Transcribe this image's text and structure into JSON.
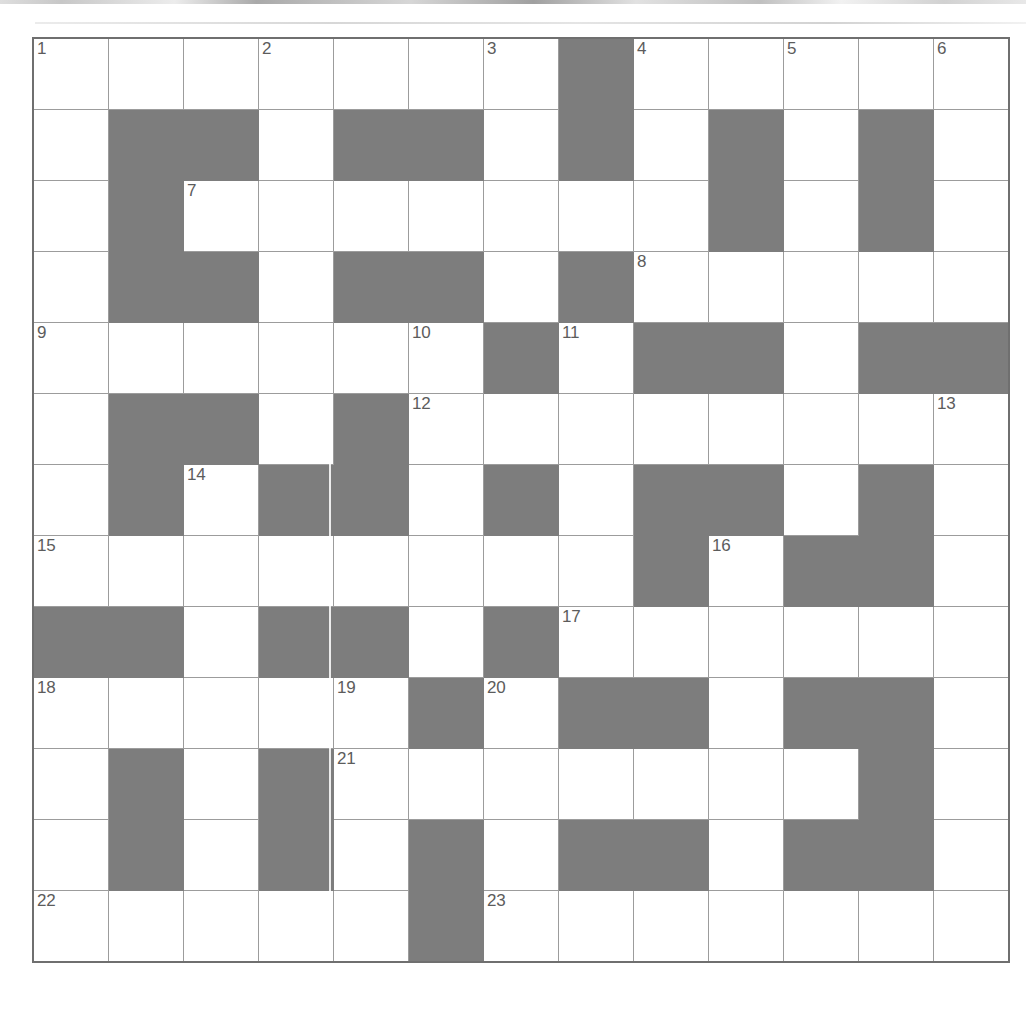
{
  "puzzle": {
    "title": "Crossword Grid",
    "type": "crossword",
    "columns": 13,
    "rows": 13,
    "colors": {
      "block": "#7d7d7d",
      "cell": "#ffffff",
      "grid_line": "#9c9c9c",
      "outer_border": "#6f6f6f",
      "number_text": "#5c5c5c"
    },
    "legend": {
      "block_char": "#",
      "open_char": "."
    },
    "grid_pattern": [
      ".......#.....",
      ".##.##.#.#.#.",
      ".#.......#.#.",
      ".##.##.#.....",
      "......#.##.##",
      ".##.#........",
      ".#.##.#.##.#.",
      "........#.##.",
      "##.##.#......",
      ".....#.##.##.",
      ".#.#.......#.",
      ".#.#.#.##.##.",
      ".....#......."
    ],
    "clue_numbers": [
      {
        "number": "1",
        "row": 1,
        "col": 1
      },
      {
        "number": "2",
        "row": 1,
        "col": 4
      },
      {
        "number": "3",
        "row": 1,
        "col": 7
      },
      {
        "number": "4",
        "row": 1,
        "col": 9
      },
      {
        "number": "5",
        "row": 1,
        "col": 11
      },
      {
        "number": "6",
        "row": 1,
        "col": 13
      },
      {
        "number": "7",
        "row": 3,
        "col": 3
      },
      {
        "number": "8",
        "row": 4,
        "col": 9
      },
      {
        "number": "9",
        "row": 5,
        "col": 1
      },
      {
        "number": "10",
        "row": 5,
        "col": 6
      },
      {
        "number": "11",
        "row": 5,
        "col": 8
      },
      {
        "number": "12",
        "row": 6,
        "col": 6
      },
      {
        "number": "13",
        "row": 6,
        "col": 13
      },
      {
        "number": "14",
        "row": 7,
        "col": 3
      },
      {
        "number": "15",
        "row": 8,
        "col": 1
      },
      {
        "number": "16",
        "row": 8,
        "col": 10
      },
      {
        "number": "17",
        "row": 9,
        "col": 8
      },
      {
        "number": "18",
        "row": 10,
        "col": 1
      },
      {
        "number": "19",
        "row": 10,
        "col": 5
      },
      {
        "number": "20",
        "row": 10,
        "col": 7
      },
      {
        "number": "21",
        "row": 11,
        "col": 5
      },
      {
        "number": "22",
        "row": 13,
        "col": 1
      },
      {
        "number": "23",
        "row": 13,
        "col": 7
      }
    ],
    "entries": {
      "across": [
        "1",
        "7",
        "8",
        "9",
        "11",
        "12",
        "14",
        "15",
        "16",
        "17",
        "18",
        "20",
        "21",
        "22",
        "23"
      ],
      "down": [
        "1",
        "2",
        "3",
        "4",
        "5",
        "6",
        "9",
        "10",
        "12",
        "13",
        "16",
        "19",
        "20"
      ]
    },
    "filled_letters": []
  }
}
